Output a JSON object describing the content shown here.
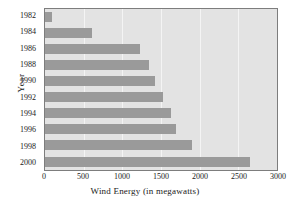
{
  "chart_data": {
    "type": "bar",
    "orientation": "horizontal",
    "title": "",
    "xlabel": "Wind Energy (in megawatts)",
    "ylabel": "Year",
    "categories": [
      "1982",
      "1984",
      "1986",
      "1988",
      "1990",
      "1992",
      "1994",
      "1996",
      "1998",
      "2000"
    ],
    "values": [
      90,
      610,
      1230,
      1350,
      1420,
      1520,
      1630,
      1700,
      1900,
      2650
    ],
    "xlim": [
      0,
      3000
    ],
    "xticks": [
      0,
      500,
      1000,
      1500,
      2000,
      2500,
      3000
    ],
    "xtick_labels": [
      "0",
      "500",
      "1000",
      "1500",
      "2000",
      "2500",
      "3000"
    ],
    "grid": true,
    "grid_axis": "x",
    "legend": null,
    "colors": {
      "bar": "#9a9a9a",
      "plot_background": "#e3e3e3",
      "gridline": "#f4f4f4",
      "axis_border": "#7d7d7d",
      "text": "#1a1a1a",
      "page_background": "#ffffff"
    }
  }
}
